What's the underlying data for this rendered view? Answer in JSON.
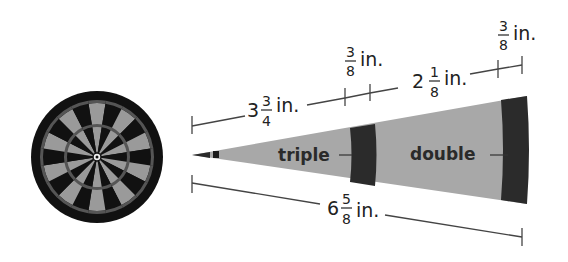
{
  "figure": {
    "colors": {
      "light_gray": "#a8a8a8",
      "dark": "#2b2b2b",
      "line": "#444444"
    }
  },
  "dimensions": {
    "inner_length": {
      "whole": "3",
      "num": "3",
      "den": "4",
      "unit": "in."
    },
    "triple_width": {
      "num": "3",
      "den": "8",
      "unit": "in."
    },
    "middle_length": {
      "whole": "2",
      "num": "1",
      "den": "8",
      "unit": "in."
    },
    "double_width": {
      "num": "3",
      "den": "8",
      "unit": "in."
    },
    "total_length": {
      "whole": "6",
      "num": "5",
      "den": "8",
      "unit": "in."
    }
  },
  "labels": {
    "triple": "triple",
    "double": "double"
  }
}
